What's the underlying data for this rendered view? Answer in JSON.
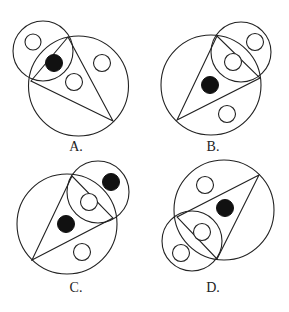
{
  "colors": {
    "line": "#222222",
    "fill": "#111111",
    "background": "#ffffff"
  },
  "options": [
    {
      "label": "A.",
      "label_pos": [
        76,
        140
      ],
      "big_circle": {
        "cx": 78.5,
        "cy": 86,
        "r": 50
      },
      "small_circle": {
        "cx": 43,
        "cy": 51,
        "r": 30
      },
      "triangle": [
        [
          68,
          37
        ],
        [
          31,
          81
        ],
        [
          113,
          121
        ]
      ],
      "dots": [
        {
          "cx": 54,
          "cy": 63,
          "r": 8.5,
          "filled": true
        },
        {
          "cx": 33,
          "cy": 42,
          "r": 8,
          "filled": false
        },
        {
          "cx": 74,
          "cy": 82,
          "r": 8.5,
          "filled": false
        },
        {
          "cx": 102,
          "cy": 63,
          "r": 8.5,
          "filled": false
        }
      ]
    },
    {
      "label": "B.",
      "label_pos": [
        213,
        140
      ],
      "big_circle": {
        "cx": 211,
        "cy": 85,
        "r": 50
      },
      "small_circle": {
        "cx": 241,
        "cy": 52,
        "r": 30
      },
      "triangle": [
        [
          217,
          36
        ],
        [
          177,
          120
        ],
        [
          260,
          78
        ]
      ],
      "dots": [
        {
          "cx": 210,
          "cy": 85,
          "r": 8.5,
          "filled": true
        },
        {
          "cx": 233,
          "cy": 62,
          "r": 8.5,
          "filled": false
        },
        {
          "cx": 255,
          "cy": 42,
          "r": 8.5,
          "filled": false
        },
        {
          "cx": 227,
          "cy": 114,
          "r": 8.5,
          "filled": false
        }
      ]
    },
    {
      "label": "C.",
      "label_pos": [
        76,
        281
      ],
      "big_circle": {
        "cx": 67,
        "cy": 224,
        "r": 50
      },
      "small_circle": {
        "cx": 98,
        "cy": 192,
        "r": 31
      },
      "triangle": [
        [
          72,
          176
        ],
        [
          32,
          260
        ],
        [
          113,
          218
        ]
      ],
      "dots": [
        {
          "cx": 66,
          "cy": 224,
          "r": 8.5,
          "filled": true
        },
        {
          "cx": 111,
          "cy": 182,
          "r": 8.5,
          "filled": true
        },
        {
          "cx": 89,
          "cy": 202,
          "r": 8.5,
          "filled": false
        },
        {
          "cx": 82,
          "cy": 252,
          "r": 8.5,
          "filled": false
        }
      ]
    },
    {
      "label": "D.",
      "label_pos": [
        213,
        281
      ],
      "big_circle": {
        "cx": 224,
        "cy": 210,
        "r": 50
      },
      "small_circle": {
        "cx": 192,
        "cy": 241,
        "r": 30
      },
      "triangle": [
        [
          259,
          175
        ],
        [
          177,
          217
        ],
        [
          217,
          259
        ]
      ],
      "dots": [
        {
          "cx": 225,
          "cy": 208,
          "r": 8.5,
          "filled": true
        },
        {
          "cx": 205,
          "cy": 185,
          "r": 8.5,
          "filled": false
        },
        {
          "cx": 202,
          "cy": 232,
          "r": 8.5,
          "filled": false
        },
        {
          "cx": 181,
          "cy": 253,
          "r": 8.5,
          "filled": false
        }
      ]
    }
  ]
}
